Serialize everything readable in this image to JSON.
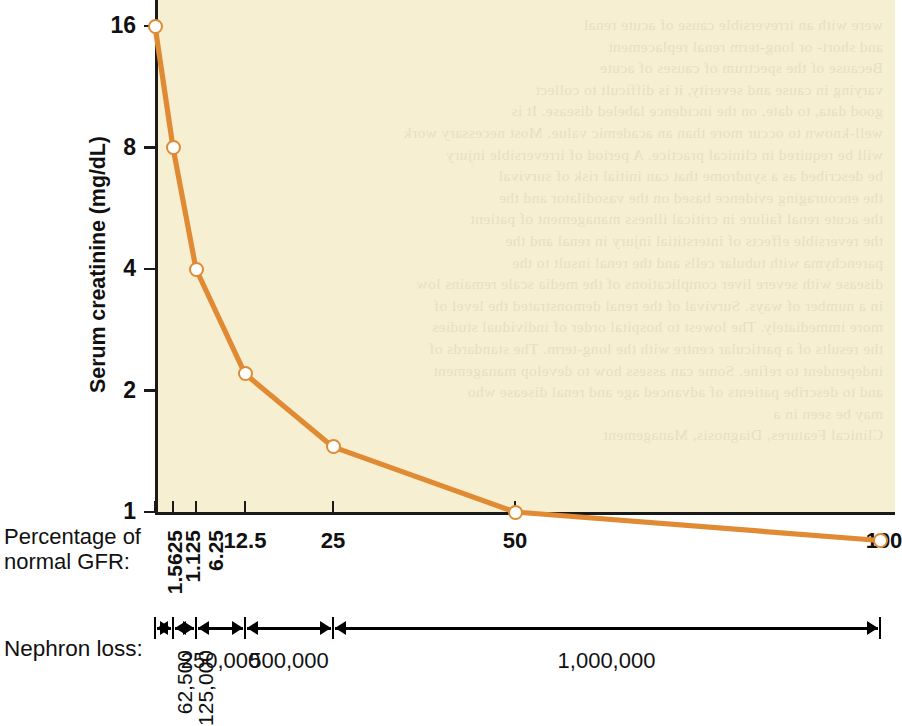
{
  "axes": {
    "y_title": "Serum creatinine (mg/dL)",
    "y_ticks": [
      "16",
      "8",
      "4",
      "2",
      "1"
    ],
    "x_caption_line1": "Percentage of",
    "x_caption_line2": "normal GFR:",
    "x_ticks": [
      "1.5625",
      "1.125",
      "6.25",
      "12.5",
      "25",
      "50",
      "100"
    ]
  },
  "nephron": {
    "caption": "Nephron loss:",
    "segments": [
      "62,500",
      "125,000",
      "250,000",
      "500,000",
      "1,000,000"
    ]
  },
  "colors": {
    "line": "#e08a33",
    "marker_fill": "#ffffff",
    "plot_background": "#f6efd2",
    "axis": "#1a1a1a"
  },
  "ghost_text": [
    "were with an irreversible cause of acute renal",
    "and short- or long-term renal replacement",
    "Because of the spectrum of causes of acute",
    "varying in cause and severity, it is difficult to collect",
    "good data, to date, on the incidence labeled disease. It is",
    "well-known to occur more than an academic value. Most necessary work",
    "will be required in clinical practice. A period of irreversible injury",
    "be described as a syndrome that can initial risk of survival",
    "the encouraging evidence based on the vasodilator and the",
    "the acute renal failure in critical illness management of patient",
    "the reversible effects of interstitial injury in renal and the",
    "parenchyma with tubular cells and the renal insult to the",
    "disease with severe liver complications of the media scale remains low",
    "in a number of ways. Survival of the renal demonstrated the level of",
    "more immediately. The lowest to hospital order of individual studies",
    "the results of a particular centre with the long-term. The standards of",
    "independent to refine. Some can assess how to develop management",
    "and to describe patients of advanced age and renal disease who",
    "may be seen in a",
    "Clinical Features, Diagnosis, Management"
  ],
  "chart_data": {
    "type": "line",
    "xlabel": "Percentage of normal GFR",
    "ylabel": "Serum creatinine (mg/dL)",
    "xscale": "log",
    "yscale": "log",
    "xlim": [
      1.5625,
      100
    ],
    "ylim": [
      0.8,
      16
    ],
    "xticks": [
      1.5625,
      1.125,
      6.25,
      12.5,
      25,
      50,
      100
    ],
    "xticklabels": [
      "1.5625",
      "1.125",
      "6.25",
      "12.5",
      "25",
      "50",
      "100"
    ],
    "yticks": [
      1,
      2,
      4,
      8,
      16
    ],
    "yticklabels": [
      "1",
      "2",
      "4",
      "8",
      "16"
    ],
    "grid": false,
    "legend": false,
    "series": [
      {
        "name": "Serum creatinine",
        "color": "#e08a33",
        "marker": "open-circle",
        "x": [
          1.5625,
          3.125,
          6.25,
          12.5,
          25,
          50,
          100
        ],
        "y": [
          16,
          8,
          4,
          2.2,
          1.45,
          1.0,
          0.85
        ]
      }
    ],
    "secondary_axis": {
      "label": "Nephron loss",
      "segments": [
        {
          "label": "62,500",
          "from_pct": 1.5625,
          "to_pct": 3.125
        },
        {
          "label": "125,000",
          "from_pct": 3.125,
          "to_pct": 6.25
        },
        {
          "label": "250,000",
          "from_pct": 6.25,
          "to_pct": 12.5
        },
        {
          "label": "500,000",
          "from_pct": 12.5,
          "to_pct": 25
        },
        {
          "label": "1,000,000",
          "from_pct": 25,
          "to_pct": 100
        }
      ]
    }
  }
}
